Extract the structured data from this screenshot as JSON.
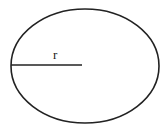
{
  "diagram": {
    "shape": "ellipse",
    "radius_label": "r",
    "stroke_color": "#222222",
    "background": "#ffffff"
  }
}
